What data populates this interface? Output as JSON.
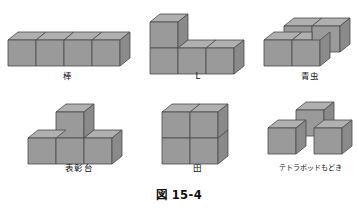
{
  "figure": {
    "caption": "図 15-4",
    "background_color": "#ffffff",
    "cube_colors": {
      "top": "#b0b0b0",
      "left": "#9a9a9a",
      "right": "#8a8a8a",
      "outline": "#4a4a4a"
    },
    "projection": "isometric",
    "shapes": [
      {
        "id": "bar",
        "label": "棒",
        "cube_count": 4,
        "description": "four cubes in a straight row",
        "cells": [
          [
            0,
            0,
            0
          ],
          [
            1,
            0,
            0
          ],
          [
            2,
            0,
            0
          ],
          [
            3,
            0,
            0
          ]
        ]
      },
      {
        "id": "l-shape",
        "label": "L",
        "cube_count": 4,
        "description": "three cubes in a row with one cube stacked on the left end",
        "cells": [
          [
            0,
            0,
            0
          ],
          [
            1,
            0,
            0
          ],
          [
            2,
            0,
            0
          ],
          [
            0,
            0,
            1
          ]
        ]
      },
      {
        "id": "caterpillar",
        "label": "青虫",
        "cube_count": 4,
        "description": "S/Z skew tetracube, two cubes in back row offset from two cubes in front row",
        "cells": [
          [
            1,
            1,
            0
          ],
          [
            2,
            1,
            0
          ],
          [
            0,
            0,
            0
          ],
          [
            1,
            0,
            0
          ]
        ]
      },
      {
        "id": "podium",
        "label": "表彰台",
        "cube_count": 4,
        "description": "three cubes in a row with one cube on top of the middle cube",
        "cells": [
          [
            0,
            0,
            0
          ],
          [
            1,
            0,
            0
          ],
          [
            2,
            0,
            0
          ],
          [
            1,
            0,
            1
          ]
        ]
      },
      {
        "id": "square",
        "label": "田",
        "cube_count": 4,
        "description": "two by two square block of cubes",
        "cells": [
          [
            0,
            0,
            0
          ],
          [
            1,
            0,
            0
          ],
          [
            0,
            0,
            1
          ],
          [
            1,
            0,
            1
          ]
        ]
      },
      {
        "id": "tetrapod",
        "label": "テトラポッドもどき",
        "cube_count": 3,
        "description": "tripod arrangement, one cube back-center raised with two cubes front-left and front-right",
        "cells": [
          [
            1,
            1,
            0
          ],
          [
            0,
            0,
            0
          ],
          [
            2,
            0,
            0
          ]
        ]
      }
    ]
  }
}
